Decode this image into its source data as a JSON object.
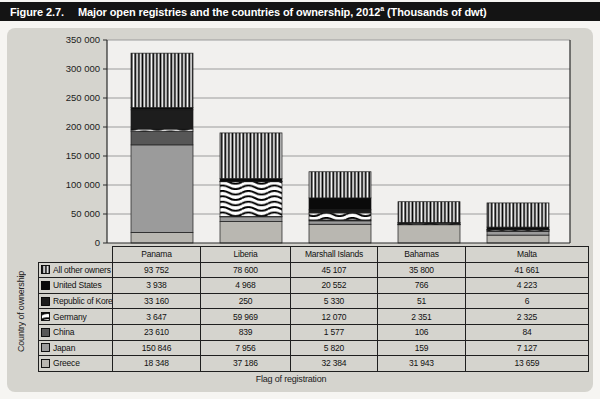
{
  "title": {
    "figure_label": "Figure 2.7.",
    "text": "Major open registries and the countries of ownership, 2012",
    "superscript": "a",
    "suffix": " (Thousands of dwt)"
  },
  "chart_data": {
    "type": "bar",
    "stacked": true,
    "categories": [
      "Panama",
      "Liberia",
      "Marshall Islands",
      "Bahamas",
      "Malta"
    ],
    "series": [
      {
        "name": "All other owners",
        "pattern": "vstripes",
        "color": "#ffffff",
        "values": [
          93752,
          78600,
          45107,
          35800,
          41661
        ]
      },
      {
        "name": "United States",
        "pattern": null,
        "color": "#0a0a0a",
        "values": [
          3938,
          4968,
          20552,
          766,
          4223
        ]
      },
      {
        "name": "Republic of Korea",
        "pattern": null,
        "color": "#1d1d1d",
        "values": [
          33160,
          250,
          5330,
          51,
          6
        ]
      },
      {
        "name": "Germany",
        "pattern": "waves",
        "color": "#ffffff",
        "values": [
          3647,
          59969,
          12070,
          2351,
          2325
        ]
      },
      {
        "name": "China",
        "pattern": null,
        "color": "#575757",
        "values": [
          23610,
          839,
          1577,
          106,
          84
        ]
      },
      {
        "name": "Japan",
        "pattern": null,
        "color": "#9b9b9b",
        "values": [
          150846,
          7956,
          5820,
          159,
          7127
        ]
      },
      {
        "name": "Greece",
        "pattern": null,
        "color": "#b9b7b1",
        "values": [
          18348,
          37186,
          32384,
          31943,
          13659
        ]
      }
    ],
    "stack_note": "bars stack bottom-to-top in reverse series order (Greece at bottom, All other owners on top)",
    "ylim": [
      0,
      350000
    ],
    "yticks": [
      {
        "value": 350000,
        "label": "350 000"
      },
      {
        "value": 300000,
        "label": "300 000"
      },
      {
        "value": 250000,
        "label": "250 000"
      },
      {
        "value": 200000,
        "label": "200 000"
      },
      {
        "value": 150000,
        "label": "150 000"
      },
      {
        "value": 100000,
        "label": "100 000"
      },
      {
        "value": 50000,
        "label": "50 000"
      },
      {
        "value": 0,
        "label": "0"
      }
    ],
    "xlabel": "Flag of registration",
    "ylabel": "Country of ownership",
    "grid": true,
    "legend_position": "table-left",
    "colors": {
      "panel_bg": "#d5d4ce",
      "plot_bg": "#f1f0ee",
      "gridline": "#9c9c9c",
      "axis": "#2a2a2a",
      "title_bar_bg": "#141414",
      "title_bar_text": "#ffffff",
      "table_border": "#1f1f1f"
    }
  }
}
